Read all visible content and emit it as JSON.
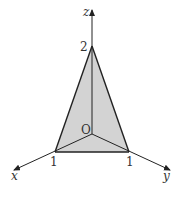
{
  "diagram": {
    "axes": {
      "x_label": "x",
      "y_label": "y",
      "z_label": "z",
      "origin_label": "O"
    },
    "points": {
      "z_intercept": "2",
      "x_intercept": "1",
      "y_intercept": "1"
    },
    "colors": {
      "fill": "#d3d3d3",
      "stroke": "#222222"
    }
  }
}
